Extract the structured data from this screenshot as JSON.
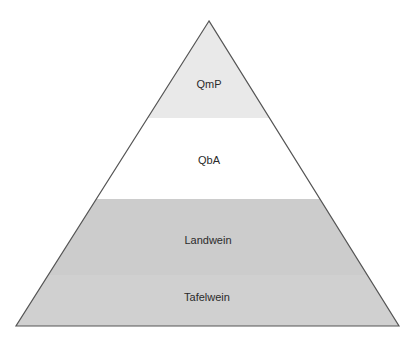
{
  "diagram": {
    "type": "pyramid",
    "levels": [
      {
        "label": "QmP",
        "fill": "#e9e9e9"
      },
      {
        "label": "QbA",
        "fill": "#ffffff"
      },
      {
        "label": "Landwein",
        "fill": "#cccccc"
      },
      {
        "label": "Tafelwein",
        "fill": "#d0d0d0"
      }
    ],
    "outline_color": "#555555"
  }
}
